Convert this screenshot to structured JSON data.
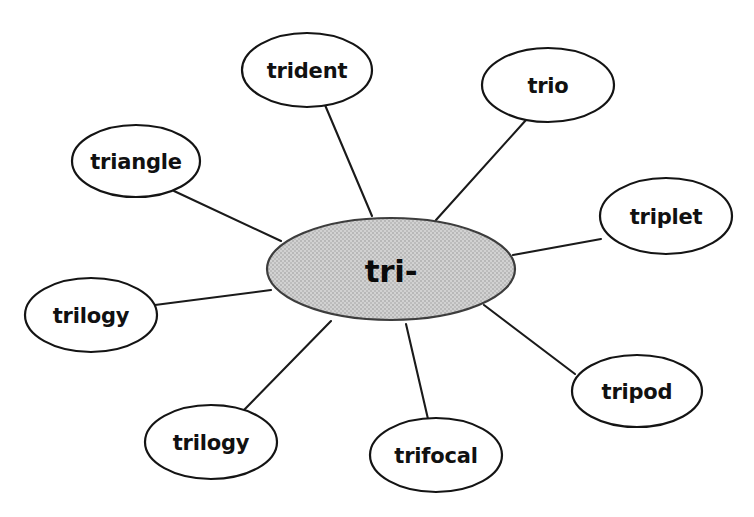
{
  "diagram": {
    "type": "word-web",
    "background_color": "#ffffff",
    "line_color": "#1a1a1a",
    "node_fill": "#ffffff",
    "node_stroke": "#141414",
    "center": {
      "label": "tri-",
      "fill_color": "#c6c6c6",
      "stroke_color": "#3d3d3d",
      "cx": 391,
      "cy": 269,
      "rx": 124,
      "ry": 51
    },
    "nodes": [
      {
        "label": "trident",
        "cx": 307,
        "cy": 70,
        "rx": 65,
        "ry": 37,
        "line": {
          "x1": 325,
          "y1": 105,
          "x2": 372,
          "y2": 216
        }
      },
      {
        "label": "trio",
        "cx": 548,
        "cy": 85,
        "rx": 66,
        "ry": 37,
        "line": {
          "x1": 526,
          "y1": 120,
          "x2": 436,
          "y2": 220
        }
      },
      {
        "label": "triangle",
        "cx": 136,
        "cy": 161,
        "rx": 64,
        "ry": 36,
        "line": {
          "x1": 174,
          "y1": 191,
          "x2": 281,
          "y2": 241
        }
      },
      {
        "label": "triplet",
        "cx": 666,
        "cy": 216,
        "rx": 66,
        "ry": 38,
        "line": {
          "x1": 601,
          "y1": 239,
          "x2": 513,
          "y2": 255
        }
      },
      {
        "label": "trilogy",
        "cx": 91,
        "cy": 315,
        "rx": 66,
        "ry": 37,
        "line": {
          "x1": 155,
          "y1": 305,
          "x2": 271,
          "y2": 290
        }
      },
      {
        "label": "tripod",
        "cx": 637,
        "cy": 391,
        "rx": 65,
        "ry": 36,
        "line": {
          "x1": 575,
          "y1": 374,
          "x2": 484,
          "y2": 305
        }
      },
      {
        "label": "trilogy",
        "cx": 211,
        "cy": 442,
        "rx": 66,
        "ry": 37,
        "line": {
          "x1": 244,
          "y1": 410,
          "x2": 331,
          "y2": 321
        }
      },
      {
        "label": "trifocal",
        "cx": 436,
        "cy": 455,
        "rx": 66,
        "ry": 37,
        "line": {
          "x1": 428,
          "y1": 419,
          "x2": 406,
          "y2": 324
        }
      }
    ]
  }
}
